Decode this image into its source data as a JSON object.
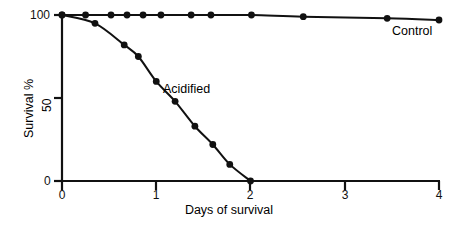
{
  "chart_data": {
    "type": "line",
    "title": "",
    "subtitle": "",
    "xlabel": "Days of survival",
    "ylabel": "Survival %",
    "xlim": [
      0,
      4
    ],
    "ylim": [
      0,
      100
    ],
    "xticks": [
      "0",
      "1",
      "2",
      "3",
      "4"
    ],
    "xtick_values": [
      0,
      1,
      2,
      3,
      4
    ],
    "yticks": [
      "0",
      "50",
      "100"
    ],
    "ytick_values": [
      0,
      50,
      100
    ],
    "grid": false,
    "legend_position": "inline-annotation",
    "marker": "filled-circle",
    "series": [
      {
        "name": "Control",
        "label": "Control",
        "x": [
          0.0,
          0.25,
          0.52,
          0.69,
          0.86,
          1.05,
          1.37,
          1.58,
          2.01,
          2.56,
          3.45,
          4.0
        ],
        "y": [
          100,
          100,
          100,
          100,
          100,
          100,
          100,
          100,
          100,
          99,
          98,
          97
        ],
        "color": "#111111"
      },
      {
        "name": "Acidified",
        "label": "Acidified",
        "x": [
          0.0,
          0.35,
          0.66,
          0.81,
          1.0,
          1.2,
          1.41,
          1.6,
          1.78,
          2.0
        ],
        "y": [
          100,
          95,
          82,
          75,
          60,
          48,
          33,
          22,
          10,
          0
        ],
        "color": "#111111"
      }
    ]
  },
  "labels": {
    "y_tick_100": "100",
    "y_tick_50": "50",
    "y_tick_0": "0",
    "x_tick_0": "0",
    "x_tick_1": "1",
    "x_tick_2": "2",
    "x_tick_3": "3",
    "x_tick_4": "4",
    "y_axis_title": "Survival %",
    "x_axis_title": "Days of survival",
    "series_control": "Control",
    "series_acidified": "Acidified"
  },
  "colors": {
    "ink": "#111111",
    "background": "#ffffff"
  }
}
